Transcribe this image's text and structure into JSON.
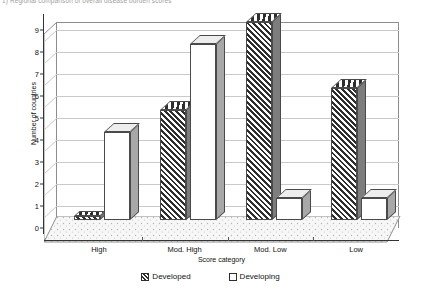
{
  "caption": "1) Regional comparison of overall disease burden scores",
  "chart_data": {
    "type": "bar",
    "title": "",
    "xlabel": "Score category",
    "ylabel": "Number of countries",
    "categories": [
      "High",
      "Mod. High",
      "Mod. Low",
      "Low"
    ],
    "series": [
      {
        "name": "Developed",
        "values": [
          0,
          5,
          9,
          6
        ]
      },
      {
        "name": "Developing",
        "values": [
          4,
          8,
          1,
          1
        ]
      }
    ],
    "ylim": [
      0,
      9
    ],
    "yticks": [
      0,
      1,
      2,
      3,
      4,
      5,
      6,
      7,
      8,
      9
    ],
    "ytick_labels": [
      "0",
      "1",
      "2",
      "3",
      "4",
      "5",
      "6",
      "7",
      "8",
      "9"
    ],
    "grid": true,
    "legend_position": "bottom",
    "style": "3d-column",
    "colors": {
      "developed_fill": "#2e2e2e",
      "developing_fill": "#ffffff",
      "bar_outline": "#4a4a4a",
      "gridline": "#c9c9c9",
      "axis": "#333333",
      "floor": "#f2f2f2"
    }
  }
}
